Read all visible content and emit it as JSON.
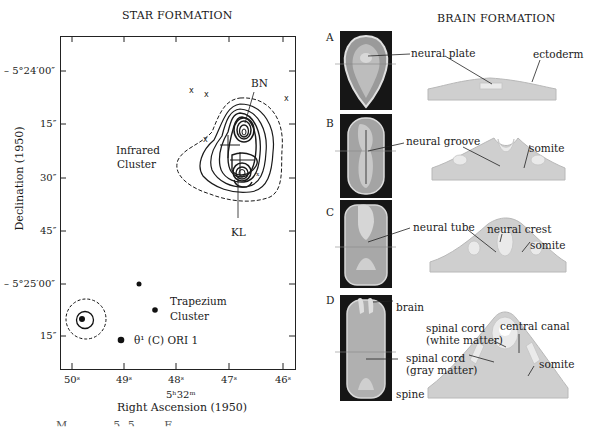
{
  "star_formation": {
    "title": "STAR FORMATION",
    "y_axis_label": "Declination (1950)",
    "y_ticks": [
      "– 5°24′00″",
      "15″",
      "30″",
      "45″",
      "– 5°25′00″",
      "15″"
    ],
    "x_ticks": [
      "50ˢ",
      "49ˢ",
      "48ˢ",
      "47ˢ",
      "46ˢ"
    ],
    "x_axis_sub": "5ʰ32ᵐ",
    "x_axis_label": "Right Ascension (1950)",
    "labels": {
      "bn": "BN",
      "kl": "KL",
      "infrared_1": "Infrared",
      "infrared_2": "Cluster",
      "trapezium_1": "Trapezium",
      "trapezium_2": "Cluster",
      "theta": "θ¹ (C) ORI 1"
    }
  },
  "brain_formation": {
    "title": "BRAIN FORMATION",
    "stages": [
      {
        "letter": "A",
        "labels": [
          "neural plate",
          "ectoderm"
        ]
      },
      {
        "letter": "B",
        "labels": [
          "neural groove",
          "somite"
        ]
      },
      {
        "letter": "C",
        "labels": [
          "neural tube",
          "neural crest",
          "somite"
        ]
      },
      {
        "letter": "D",
        "labels": [
          "brain",
          "spinal cord",
          "(white matter)",
          "central canal",
          "spinal cord",
          "(gray matter)",
          "somite",
          "spine"
        ]
      }
    ]
  },
  "caption_fragment": "M... ... 5.5 ... F... ... ... ... ... ... ..."
}
